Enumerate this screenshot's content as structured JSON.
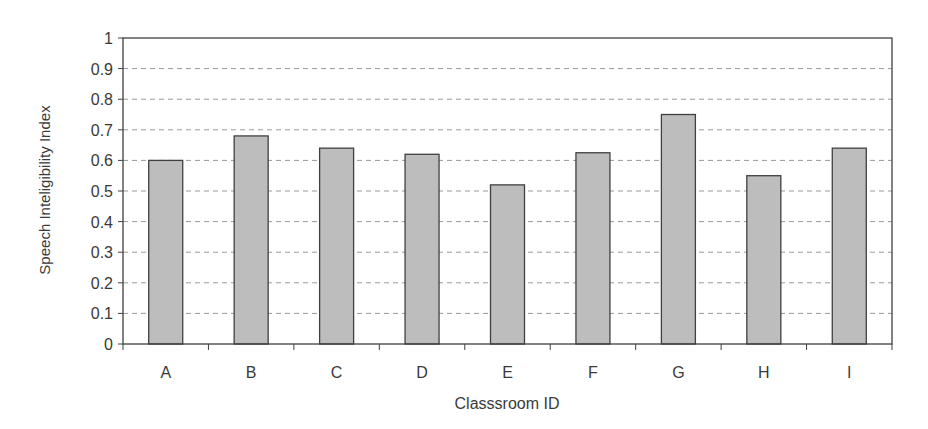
{
  "chart_data": {
    "type": "bar",
    "title": "",
    "xlabel": "Classsroom ID",
    "ylabel": "Speech Inteligibility Index",
    "categories": [
      "A",
      "B",
      "C",
      "D",
      "E",
      "F",
      "G",
      "H",
      "I"
    ],
    "values": [
      0.6,
      0.68,
      0.64,
      0.62,
      0.52,
      0.625,
      0.75,
      0.55,
      0.64
    ],
    "ylim": [
      0,
      1
    ],
    "yticks": [
      "0",
      "0.1",
      "0.2",
      "0.3",
      "0.4",
      "0.5",
      "0.6",
      "0.7",
      "0.8",
      "0.9",
      "1"
    ],
    "grid": {
      "y": true,
      "style": "dashed"
    },
    "legend": null
  },
  "style": {
    "bar_fill": "#bdbdbd",
    "bar_stroke": "#404040",
    "axis_color": "#404040",
    "grid_color": "#9a9a9a",
    "text_color": "#3a3a3a"
  }
}
